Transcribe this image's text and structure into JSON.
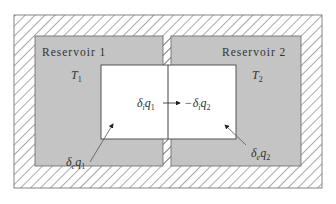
{
  "diagram": {
    "type": "thermodynamic-reservoirs",
    "colors": {
      "background": "#ffffff",
      "hatch_stroke": "#555555",
      "reservoir_fill": "#c4c4c4",
      "system_fill": "#ffffff",
      "line": "#444444",
      "text": "#333333"
    },
    "reservoir1": {
      "label": "Reservoir 1",
      "temp_symbol": "T",
      "temp_sub": "1"
    },
    "reservoir2": {
      "label": "Reservoir 2",
      "temp_symbol": "T",
      "temp_sub": "2"
    },
    "internal_flow": {
      "left_delta": "δ",
      "left_delta_sub": "i",
      "left_q": "q",
      "left_q_sub": "1",
      "minus": "−",
      "right_delta": "δ",
      "right_delta_sub": "i",
      "right_q": "q",
      "right_q_sub": "2"
    },
    "external_flow1": {
      "delta": "δ",
      "delta_sub": "e",
      "q": "q",
      "q_sub": "1"
    },
    "external_flow2": {
      "delta": "δ",
      "delta_sub": "e",
      "q": "q",
      "q_sub": "2"
    }
  }
}
